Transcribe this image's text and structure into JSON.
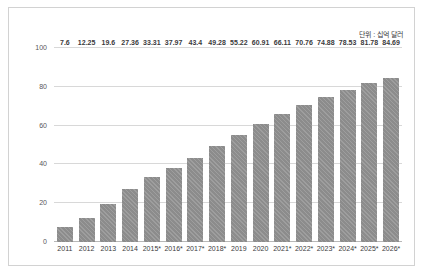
{
  "chart_data": {
    "type": "bar",
    "title": "",
    "subtitle": "",
    "xlabel": "",
    "ylabel": "",
    "annotation": "단위 : 십억 달러",
    "ylim": [
      0,
      100
    ],
    "yticks": [
      0,
      20,
      40,
      60,
      80,
      100
    ],
    "grid": true,
    "legend": null,
    "bar_color": "#8c8c8c",
    "categories": [
      "2011",
      "2012",
      "2013",
      "2014",
      "2015*",
      "2016*",
      "2017*",
      "2018*",
      "2019",
      "2020",
      "2021*",
      "2022*",
      "2023*",
      "2024*",
      "2025*",
      "2026*"
    ],
    "values": [
      7.6,
      12.25,
      19.6,
      27.36,
      33.31,
      37.97,
      43.4,
      49.28,
      55.22,
      60.91,
      66.11,
      70.76,
      74.88,
      78.53,
      81.78,
      84.69
    ],
    "value_labels": [
      "7.6",
      "12.25",
      "19.6",
      "27.36",
      "33.31",
      "37.97",
      "43.4",
      "49.28",
      "55.22",
      "60.91",
      "66.11",
      "70.76",
      "74.88",
      "78.53",
      "81.78",
      "84.69"
    ]
  }
}
